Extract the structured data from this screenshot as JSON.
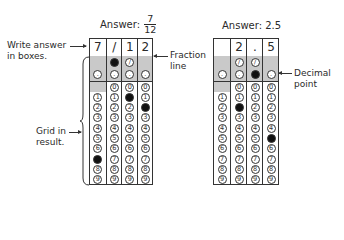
{
  "left": {
    "title_prefix": "Answer: ",
    "numerator": "7",
    "denominator": "12",
    "boxes": [
      "7",
      "/",
      "1",
      "2"
    ],
    "filled": {
      "slash_col": 1,
      "digits": [
        {
          "col": 0,
          "digit": 7
        },
        {
          "col": 2,
          "digit": 1
        },
        {
          "col": 3,
          "digit": 2
        }
      ]
    }
  },
  "right": {
    "title": "Answer: 2.5",
    "boxes": [
      "",
      "2",
      ".",
      "5"
    ],
    "filled": {
      "decimal_col": 2,
      "digits": [
        {
          "col": 1,
          "digit": 2
        },
        {
          "col": 3,
          "digit": 5
        }
      ]
    }
  },
  "annotations": {
    "write_answer_line1": "Write answer",
    "write_answer_line2": "in boxes.",
    "grid_in_line1": "Grid in",
    "grid_in_line2": "result.",
    "fraction_line1": "Fraction",
    "fraction_line2": "line",
    "decimal_line1": "Decimal",
    "decimal_line2": "point"
  },
  "bubble_symbols": {
    "slash": "⊘",
    "dot": "·",
    "digits": [
      "0",
      "1",
      "2",
      "3",
      "4",
      "5",
      "6",
      "7",
      "8",
      "9"
    ]
  }
}
